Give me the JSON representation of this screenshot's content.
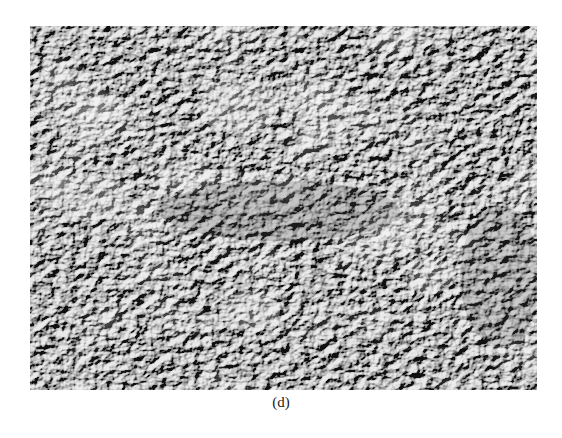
{
  "figure": {
    "panel_label": "(d)",
    "image": {
      "kind": "grayscale-surface-micrograph",
      "base_color": "#6e6e6e",
      "highlight_color": "#f2f2f2",
      "shadow_color": "#3e3e3e"
    }
  }
}
